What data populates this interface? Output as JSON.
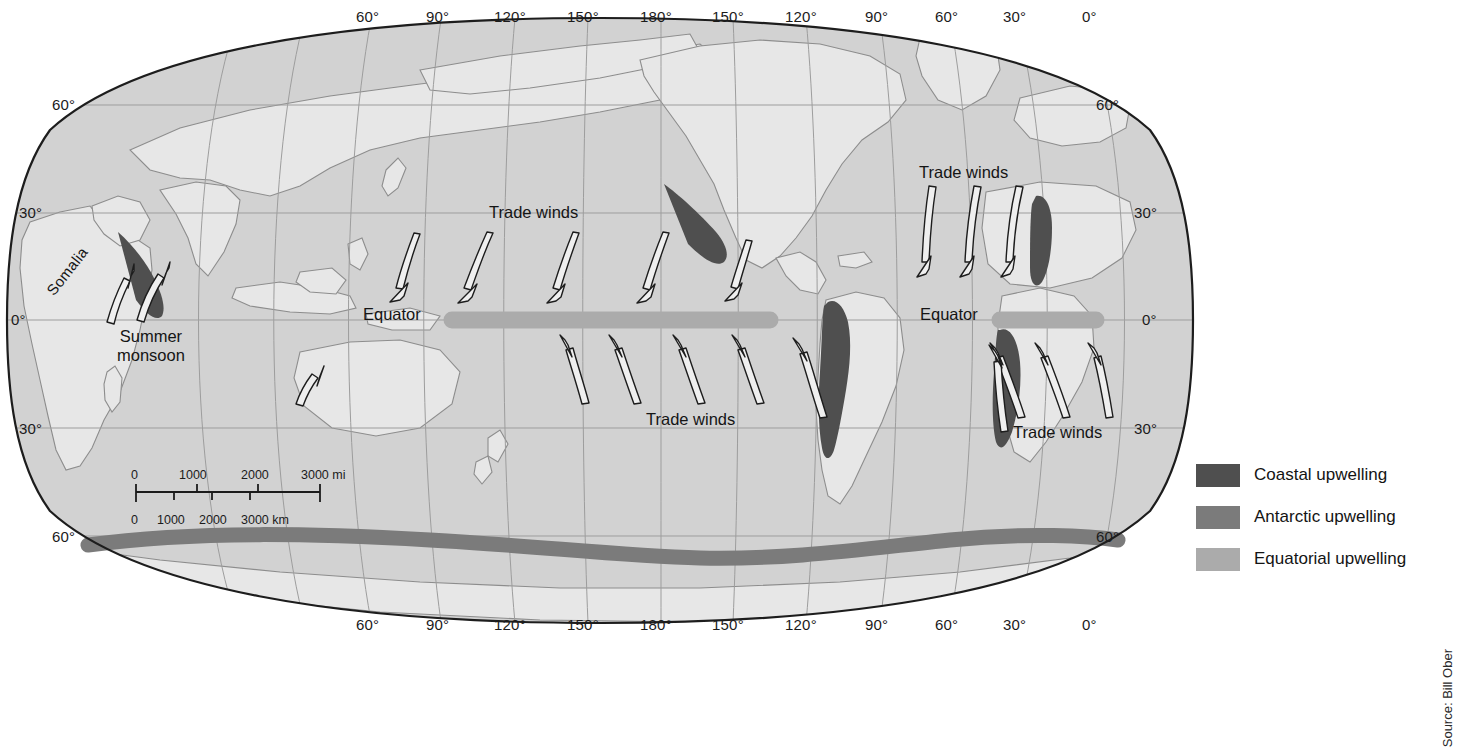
{
  "figure": {
    "kind": "world-map-upwelling",
    "source_credit": "Source: Bill Ober"
  },
  "colors": {
    "ocean": "#d2d2d2",
    "land": "#e4e4e4",
    "coastline": "#8a8a8a",
    "graticule": "#9a9a9a",
    "map_border": "#1d1d1d",
    "coastal_upwelling": "#4f4f4f",
    "antarctic_upwelling": "#7b7b7b",
    "equatorial_upwelling": "#ababab",
    "arrow_fill": "#ededed",
    "arrow_stroke": "#1d1d1d",
    "text": "#151515"
  },
  "graticule": {
    "longitude_top": [
      {
        "label": "60°",
        "x": 371
      },
      {
        "label": "90°",
        "x": 441
      },
      {
        "label": "120°",
        "x": 515
      },
      {
        "label": "150°",
        "x": 588
      },
      {
        "label": "180°",
        "x": 661
      },
      {
        "label": "150°",
        "x": 733
      },
      {
        "label": "120°",
        "x": 806
      },
      {
        "label": "90°",
        "x": 880
      },
      {
        "label": "60°",
        "x": 950
      },
      {
        "label": "30°",
        "x": 1018
      },
      {
        "label": "0°",
        "x": 1090
      }
    ],
    "longitude_bottom": [
      {
        "label": "60°",
        "x": 371
      },
      {
        "label": "90°",
        "x": 441
      },
      {
        "label": "120°",
        "x": 515
      },
      {
        "label": "150°",
        "x": 588
      },
      {
        "label": "180°",
        "x": 661
      },
      {
        "label": "150°",
        "x": 733
      },
      {
        "label": "120°",
        "x": 806
      },
      {
        "label": "90°",
        "x": 880
      },
      {
        "label": "60°",
        "x": 950
      },
      {
        "label": "30°",
        "x": 1018
      },
      {
        "label": "0°",
        "x": 1090
      }
    ],
    "latitude_left": [
      {
        "label": "60°",
        "x": 52,
        "y": 98
      },
      {
        "label": "30°",
        "x": 19,
        "y": 205
      },
      {
        "label": "0°",
        "x": 11,
        "y": 312
      },
      {
        "label": "30°",
        "x": 19,
        "y": 424
      },
      {
        "label": "60°",
        "x": 52,
        "y": 532
      }
    ],
    "latitude_right": [
      {
        "label": "60°",
        "x": 1094,
        "y": 98
      },
      {
        "label": "30°",
        "x": 1132,
        "y": 205
      },
      {
        "label": "0°",
        "x": 1140,
        "y": 312
      },
      {
        "label": "30°",
        "x": 1132,
        "y": 424
      },
      {
        "label": "60°",
        "x": 1094,
        "y": 532
      }
    ]
  },
  "annotations": [
    {
      "id": "equator-pacific",
      "text": "Equator",
      "x": 363,
      "y": 305,
      "rotate": 0
    },
    {
      "id": "equator-atlantic",
      "text": "Equator",
      "x": 920,
      "y": 305,
      "rotate": 0
    },
    {
      "id": "trade-winds-n-pacific",
      "text": "Trade winds",
      "x": 489,
      "y": 203,
      "rotate": 0
    },
    {
      "id": "trade-winds-s-pacific",
      "text": "Trade winds",
      "x": 646,
      "y": 410,
      "rotate": 0
    },
    {
      "id": "trade-winds-n-atlantic",
      "text": "Trade winds",
      "x": 919,
      "y": 163,
      "rotate": 0
    },
    {
      "id": "trade-winds-s-atlantic",
      "text": "Trade winds",
      "x": 1013,
      "y": 423,
      "rotate": 0
    },
    {
      "id": "somalia",
      "text": "Somalia",
      "x": 43,
      "y": 288,
      "rotate": -52
    }
  ],
  "monsoon_label": {
    "line1": "Summer",
    "line2": "monsoon",
    "x": 122,
    "y": 327
  },
  "scale_bar": {
    "miles": {
      "unit_suffix": "mi",
      "ticks": [
        "0",
        "1000",
        "2000",
        "3000"
      ]
    },
    "miles_display": [
      {
        "label": "0",
        "x": 0
      },
      {
        "label": "1000",
        "x": 57
      },
      {
        "label": "2000",
        "x": 124
      },
      {
        "label": "3000 mi",
        "x": 186
      }
    ],
    "km_display": [
      {
        "label": "0",
        "x": 0
      },
      {
        "label": "1000",
        "x": 28
      },
      {
        "label": "2000",
        "x": 70
      },
      {
        "label": "3000 km",
        "x": 112
      }
    ]
  },
  "legend": {
    "items": [
      {
        "label": "Coastal upwelling",
        "color": "#4f4f4f",
        "name": "coastal-upwelling"
      },
      {
        "label": "Antarctic upwelling",
        "color": "#7b7b7b",
        "name": "antarctic-upwelling"
      },
      {
        "label": "Equatorial upwelling",
        "color": "#ababab",
        "name": "equatorial-upwelling"
      }
    ]
  },
  "map_features": {
    "equatorial_bands": [
      {
        "name": "pacific-equatorial-band",
        "x1": 444,
        "x2": 778,
        "y": 320,
        "thickness": 17
      },
      {
        "name": "atlantic-equatorial-band",
        "x1": 992,
        "x2": 1104,
        "y": 320,
        "thickness": 17
      }
    ],
    "coastal_upwelling_zones": [
      "somalia-coast",
      "california-coast",
      "peru-chile-coast",
      "northwest-africa-coast",
      "southwest-africa-coast"
    ],
    "antarctic_band": "circumpolar-antarctic-upwelling"
  }
}
